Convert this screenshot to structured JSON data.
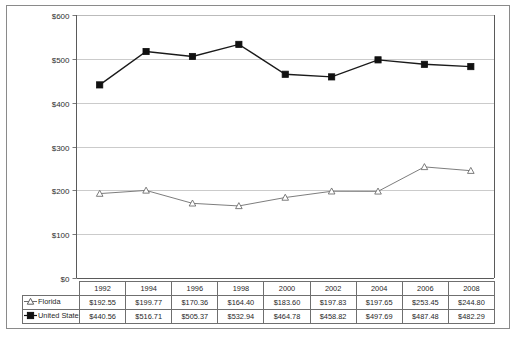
{
  "chart_data": {
    "type": "line",
    "title": "",
    "xlabel": "",
    "ylabel": "",
    "categories": [
      "1992",
      "1994",
      "1996",
      "1998",
      "2000",
      "2002",
      "2004",
      "2006",
      "2008"
    ],
    "ylim": [
      0,
      600
    ],
    "yticks": [
      "$0",
      "$100",
      "$200",
      "$300",
      "$400",
      "$500",
      "$600"
    ],
    "ytick_values": [
      0,
      100,
      200,
      300,
      400,
      500,
      600
    ],
    "grid": "horizontal",
    "legend_position": "row-labels-in-data-table",
    "series": [
      {
        "name": "Florida",
        "marker": "open-triangle",
        "color": "#6e6e6e",
        "values": [
          192.55,
          199.77,
          170.36,
          164.4,
          183.6,
          197.83,
          197.65,
          253.45,
          244.8
        ],
        "labels": [
          "$192.55",
          "$199.77",
          "$170.36",
          "$164.40",
          "$183.60",
          "$197.83",
          "$197.65",
          "$253.45",
          "$244.80"
        ]
      },
      {
        "name": "United States",
        "marker": "filled-square",
        "color": "#111111",
        "values": [
          440.56,
          516.71,
          505.37,
          532.94,
          464.78,
          458.82,
          497.69,
          487.48,
          482.29
        ],
        "labels": [
          "$440.56",
          "$516.71",
          "$505.37",
          "$532.94",
          "$464.78",
          "$458.82",
          "$497.69",
          "$487.48",
          "$482.29"
        ]
      }
    ]
  },
  "table": {
    "corner_label": "",
    "header": [
      "1992",
      "1994",
      "1996",
      "1998",
      "2000",
      "2002",
      "2004",
      "2006",
      "2008"
    ],
    "rows": [
      {
        "label": "Florida",
        "marker": "open-triangle",
        "cells": [
          "$192.55",
          "$199.77",
          "$170.36",
          "$164.40",
          "$183.60",
          "$197.83",
          "$197.65",
          "$253.45",
          "$244.80"
        ]
      },
      {
        "label": "United States",
        "marker": "filled-square",
        "cells": [
          "$440.56",
          "$516.71",
          "$505.37",
          "$532.94",
          "$464.78",
          "$458.82",
          "$497.69",
          "$487.48",
          "$482.29"
        ]
      }
    ]
  },
  "colors": {
    "series_us": "#111111",
    "series_fl": "#6e6e6e",
    "gridline": "#b5b5b5",
    "frame": "#8a8a8a"
  }
}
